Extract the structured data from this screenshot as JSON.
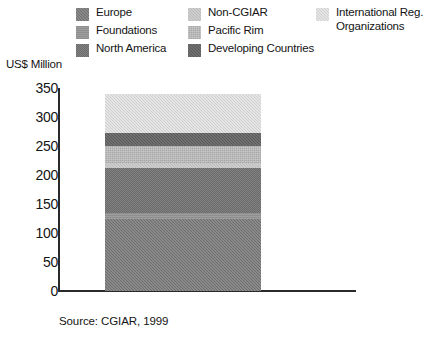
{
  "axis": {
    "y_title": "US$ Million",
    "y_ticks": [
      "350",
      "300",
      "250",
      "200",
      "150",
      "100",
      "50",
      "0"
    ]
  },
  "legend": {
    "columns": [
      [
        {
          "label": "Europe",
          "swatch": "fill-europe",
          "color": "#6d6d6d"
        },
        {
          "label": "Foundations",
          "swatch": "fill-foundations",
          "color": "#8e8e8e"
        },
        {
          "label": "North America",
          "swatch": "fill-northamerica",
          "color": "#6a6a6a"
        }
      ],
      [
        {
          "label": "Non-CGIAR",
          "swatch": "fill-noncgiar",
          "color": "#b9b9b9"
        },
        {
          "label": "Pacific Rim",
          "swatch": "fill-pacificrim",
          "color": "#a8a8a8"
        },
        {
          "label": "Developing Countries",
          "swatch": "fill-developing",
          "color": "#595959"
        }
      ],
      [
        {
          "label": "International Reg.\nOrganizations",
          "swatch": "fill-intorg",
          "color": "#cfcfcf"
        }
      ]
    ]
  },
  "source": "Source: CGIAR, 1999",
  "chart_data": {
    "type": "bar",
    "subtype": "stacked-single-bar",
    "title": "",
    "xlabel": "",
    "ylabel": "US$ Million",
    "ylim": [
      0,
      350
    ],
    "ytick_step": 50,
    "grid": false,
    "legend_position": "top",
    "categories": [
      ""
    ],
    "total": 340,
    "series": [
      {
        "name": "Europe",
        "values": [
          124
        ],
        "start": 0,
        "end": 124,
        "color": "#6d6d6d",
        "swatch": "fill-europe"
      },
      {
        "name": "Foundations",
        "values": [
          10
        ],
        "start": 124,
        "end": 134,
        "color": "#8e8e8e",
        "swatch": "fill-foundations"
      },
      {
        "name": "North America",
        "values": [
          78
        ],
        "start": 134,
        "end": 212,
        "color": "#6a6a6a",
        "swatch": "fill-northamerica"
      },
      {
        "name": "Non-CGIAR",
        "values": [
          8
        ],
        "start": 212,
        "end": 220,
        "color": "#b9b9b9",
        "swatch": "fill-noncgiar"
      },
      {
        "name": "Pacific Rim",
        "values": [
          30
        ],
        "start": 220,
        "end": 250,
        "color": "#a8a8a8",
        "swatch": "fill-pacificrim"
      },
      {
        "name": "Developing Countries",
        "values": [
          22
        ],
        "start": 250,
        "end": 272,
        "color": "#595959",
        "swatch": "fill-developing"
      },
      {
        "name": "International Reg. Organizations",
        "values": [
          68
        ],
        "start": 272,
        "end": 340,
        "color": "#cfcfcf",
        "swatch": "fill-intorg"
      }
    ]
  }
}
